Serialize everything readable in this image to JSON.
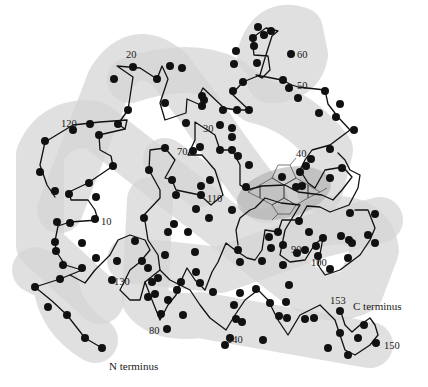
{
  "figure": {
    "residue_labels": [
      {
        "text": "10",
        "x": 101,
        "y": 225
      },
      {
        "text": "20",
        "x": 126,
        "y": 58
      },
      {
        "text": "30",
        "x": 203,
        "y": 130
      },
      {
        "text": "40",
        "x": 297,
        "y": 157
      },
      {
        "text": "50",
        "x": 297,
        "y": 88
      },
      {
        "text": "60",
        "x": 297,
        "y": 57
      },
      {
        "text": "70",
        "x": 178,
        "y": 154
      },
      {
        "text": "80",
        "x": 150,
        "y": 333
      },
      {
        "text": "90",
        "x": 291,
        "y": 251
      },
      {
        "text": "100",
        "x": 311,
        "y": 265
      },
      {
        "text": "110",
        "x": 207,
        "y": 201
      },
      {
        "text": "120",
        "x": 61,
        "y": 126
      },
      {
        "text": "130",
        "x": 115,
        "y": 285
      },
      {
        "text": "140",
        "x": 228,
        "y": 343
      },
      {
        "text": "150",
        "x": 384,
        "y": 348
      },
      {
        "text": "153",
        "x": 330,
        "y": 303
      }
    ],
    "terminus_labels": {
      "n_terminus": "N terminus",
      "c_terminus": "C terminus"
    },
    "heme_group": {
      "label": "heme",
      "visible_text": ""
    },
    "colors": {
      "tube": "#d4d4d4",
      "backbone": "#111111",
      "node": "#111111",
      "background": "#ffffff"
    }
  }
}
